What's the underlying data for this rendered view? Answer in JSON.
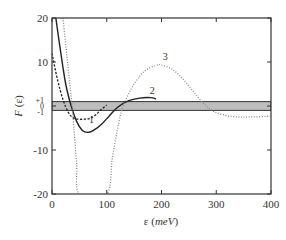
{
  "chart_data": {
    "type": "line",
    "title": "",
    "xlabel": "ε (meV)",
    "xlabel_parts": {
      "symbol": "ε",
      "unit": "meV"
    },
    "ylabel": "F (ε)",
    "ylabel_parts": {
      "symbol": "F",
      "arg": "(ε)"
    },
    "xlim": [
      0,
      400
    ],
    "ylim": [
      -20,
      20
    ],
    "x_ticks": [
      0,
      100,
      200,
      300,
      400
    ],
    "x_tick_labels": [
      "0",
      "100",
      "200",
      "300",
      "400"
    ],
    "y_ticks": [
      -20,
      -10,
      0,
      10,
      20
    ],
    "y_tick_labels": [
      "-20",
      "-10",
      "0",
      "10",
      "20"
    ],
    "y_minor_labels": [
      "+1",
      "0",
      "-1"
    ],
    "grid": false,
    "legend": "none",
    "shaded_band": {
      "ymin": -1,
      "ymax": 1,
      "color": "#bdbdbd"
    },
    "series": [
      {
        "name": "1",
        "style": "dashed",
        "color": "#222222",
        "x": [
          0,
          10,
          20,
          30,
          40,
          50,
          60,
          70,
          80,
          90,
          100
        ],
        "y": [
          12,
          6,
          1.5,
          -1.5,
          -2.8,
          -3.0,
          -3.0,
          -2.8,
          -2.0,
          -0.8,
          0.2
        ],
        "label_position": [
          72,
          -3.8
        ]
      },
      {
        "name": "2",
        "style": "solid",
        "color": "#222222",
        "x": [
          7,
          15,
          25,
          35,
          45,
          55,
          65,
          75,
          90,
          105,
          120,
          140,
          160,
          180,
          190
        ],
        "y": [
          20,
          13,
          5,
          0,
          -3.5,
          -5.5,
          -6.0,
          -5.6,
          -4.2,
          -2.2,
          -0.3,
          1.2,
          1.8,
          1.9,
          1.6
        ],
        "label_position": [
          183,
          2.8
        ]
      },
      {
        "name": "3",
        "style": "dotted",
        "color": "#888888",
        "x": [
          20,
          25,
          30,
          35,
          40,
          45,
          50,
          100,
          110,
          120,
          130,
          150,
          170,
          190,
          200,
          220,
          240,
          260,
          280,
          300,
          330,
          360,
          400
        ],
        "y": [
          20,
          14,
          8,
          2,
          -5,
          -13,
          -20,
          -20,
          -12,
          -5,
          0,
          5,
          8,
          9.2,
          9.3,
          8.3,
          6.0,
          3.0,
          0.2,
          -1.5,
          -2.4,
          -2.5,
          -2.3
        ],
        "label_position": [
          207,
          10.5
        ]
      }
    ]
  }
}
